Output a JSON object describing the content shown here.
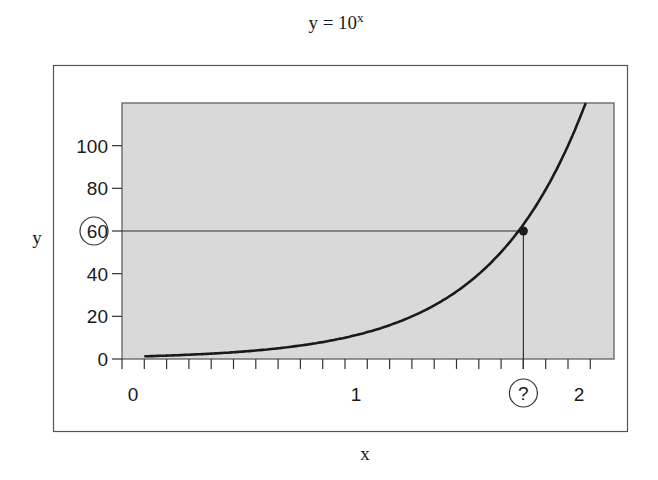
{
  "chart_data": {
    "type": "line",
    "title_base": "y = 10",
    "title_exponent": "x",
    "xlabel": "x",
    "ylabel": "y",
    "xlim": [
      0,
      2.2
    ],
    "ylim": [
      0,
      120
    ],
    "x_ticks_minor_step": 0.1,
    "x_tick_labels": [
      {
        "value": 0,
        "label": "0"
      },
      {
        "value": 1,
        "label": "1"
      },
      {
        "value": 2,
        "label": "2"
      }
    ],
    "y_tick_labels": [
      {
        "value": 0,
        "label": "0"
      },
      {
        "value": 20,
        "label": "20"
      },
      {
        "value": 40,
        "label": "40"
      },
      {
        "value": 60,
        "label": "60",
        "circled": true
      },
      {
        "value": 80,
        "label": "80"
      },
      {
        "value": 100,
        "label": "100"
      }
    ],
    "series": [
      {
        "name": "y = 10^x",
        "function": "10^x",
        "x_start": 0.1,
        "x_end": 2.08,
        "x": [
          0.1,
          0.2,
          0.4,
          0.6,
          0.8,
          1.0,
          1.2,
          1.4,
          1.6,
          1.8,
          2.0,
          2.08
        ],
        "y": [
          1.26,
          1.58,
          2.51,
          3.98,
          6.31,
          10,
          15.85,
          25.12,
          39.81,
          63.1,
          100,
          120
        ]
      }
    ],
    "highlight_point": {
      "x": 1.8,
      "y": 60,
      "x_label": "?",
      "y_label": "60"
    },
    "guide_lines": [
      {
        "type": "horizontal",
        "y": 60,
        "from_x": 0,
        "to_x": 1.8
      },
      {
        "type": "vertical",
        "x": 1.8,
        "from_y": 0,
        "to_y": 60
      }
    ],
    "grid": false,
    "legend": "none",
    "plot_background": "#d9d9d9"
  },
  "colors": {
    "plot_fill": "#d9d9d9",
    "line": "#1a1a1a",
    "frame": "#555555",
    "text": "#1a1a1a"
  }
}
